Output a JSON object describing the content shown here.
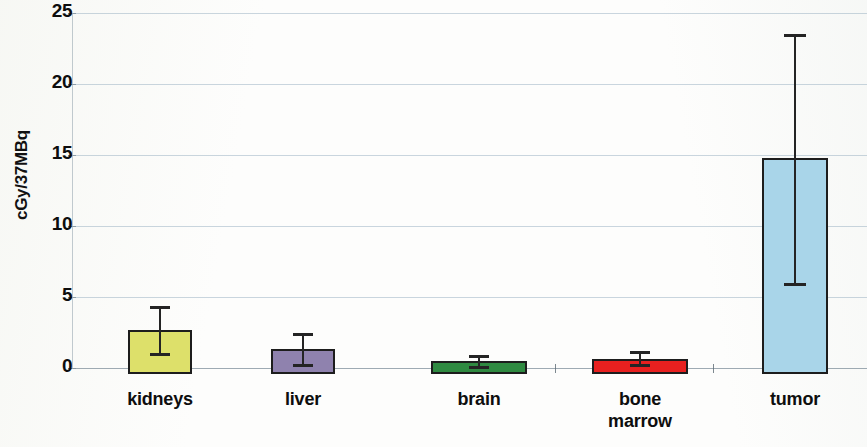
{
  "chart_data": {
    "type": "bar",
    "title": "",
    "subtitle": "",
    "xlabel": "",
    "ylabel": "cGy/37MBq",
    "ylim": [
      0,
      25
    ],
    "yticks": [
      0,
      5,
      10,
      15,
      20,
      25
    ],
    "ytick_labels": [
      "0",
      "5",
      "10",
      "15",
      "20",
      "25"
    ],
    "grid": true,
    "grid_axis": "y",
    "legend": false,
    "legend_position": "none",
    "categories": [
      "kidneys",
      "liver",
      "brain",
      "bone marrow",
      "tumor"
    ],
    "category_labels_wrapped": [
      [
        "kidneys"
      ],
      [
        "liver"
      ],
      [
        "brain"
      ],
      [
        "bone",
        "marrow"
      ],
      [
        "tumor"
      ]
    ],
    "values": [
      2.7,
      1.35,
      0.5,
      0.65,
      14.8
    ],
    "error_high": [
      4.4,
      2.5,
      0.9,
      1.2,
      23.5
    ],
    "error_low": [
      1.05,
      0.3,
      0.15,
      0.25,
      6.0
    ],
    "bar_colors": [
      "#dde06a",
      "#8f82ae",
      "#2f8a41",
      "#e8201f",
      "#a9d5e9"
    ],
    "bar_edge_color": "#1d1d1d",
    "error_bar_color": "#242424",
    "grid_color": "#9fb5c4",
    "axis_text_color": "#0d0d0d"
  },
  "axis": {
    "y_title": "cGy/37MBq"
  }
}
